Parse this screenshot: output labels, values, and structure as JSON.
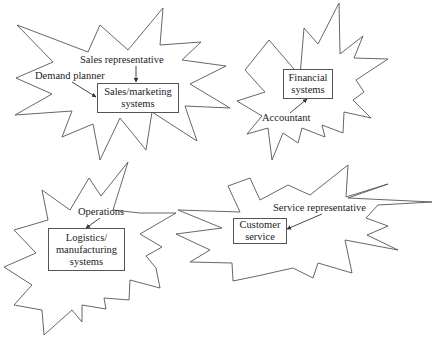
{
  "diagram": {
    "clusters": [
      {
        "name": "sales",
        "system": {
          "lines": [
            "Sales/marketing",
            "systems"
          ]
        },
        "roles": [
          "Sales representative",
          "Demand planner"
        ]
      },
      {
        "name": "financial",
        "system": {
          "lines": [
            "Financial",
            "systems"
          ]
        },
        "roles": [
          "Accountant"
        ]
      },
      {
        "name": "logistics",
        "system": {
          "lines": [
            "Logistics/",
            "manufacturing",
            "systems"
          ]
        },
        "roles": [
          "Operations"
        ]
      },
      {
        "name": "customer-service",
        "system": {
          "lines": [
            "Customer",
            "service"
          ]
        },
        "roles": [
          "Service representative"
        ]
      }
    ],
    "colors": {
      "outline": "#555555",
      "text": "#222222",
      "background": "#ffffff"
    }
  }
}
